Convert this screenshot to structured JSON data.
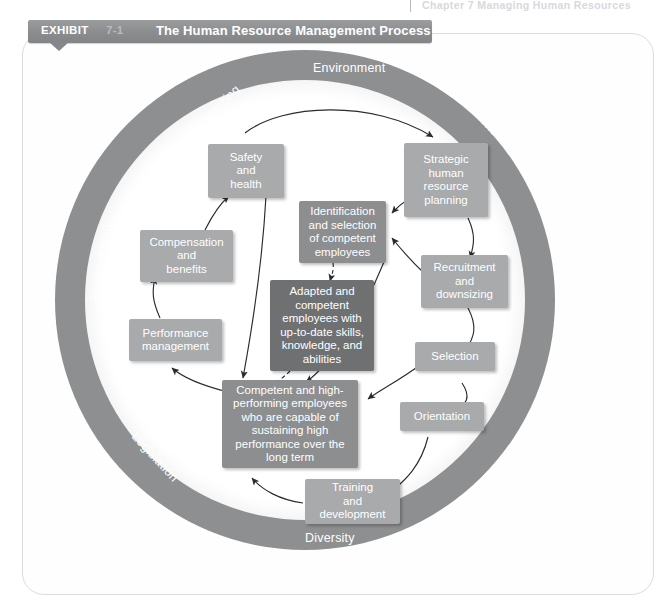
{
  "runhead": {
    "text": "Chapter 7  Managing Human Resources"
  },
  "header": {
    "exhibit_label": "EXHIBIT",
    "exhibit_number": "7-1",
    "title": "The Human Resource Management Process"
  },
  "colors": {
    "ring": "#8d8f91",
    "box_light": "#a8aaac",
    "box_mid": "#8c8e90",
    "box_dark": "#6e7072",
    "header_bar": "#8b8d8f",
    "text": "#ffffff"
  },
  "environment_factors": [
    {
      "name": "environment",
      "label": "Environment"
    },
    {
      "name": "downsizing",
      "label": "Downsizing"
    },
    {
      "name": "unions",
      "label": "Unions"
    },
    {
      "name": "restructuring",
      "label": "Restructuring"
    },
    {
      "name": "work-process",
      "label": "Work Process"
    },
    {
      "name": "legislation",
      "label": "Legislation"
    },
    {
      "name": "diversity",
      "label": "Diversity"
    }
  ],
  "process_steps": [
    {
      "name": "strategic-human-resource-planning",
      "label": "Strategic\nhuman\nresource\nplanning"
    },
    {
      "name": "recruitment-and-downsizing",
      "label": "Recruitment\nand\ndownsizing"
    },
    {
      "name": "selection",
      "label": "Selection"
    },
    {
      "name": "orientation",
      "label": "Orientation"
    },
    {
      "name": "training-and-development",
      "label": "Training\nand\ndevelopment"
    },
    {
      "name": "performance-management",
      "label": "Performance\nmanagement"
    },
    {
      "name": "compensation-and-benefits",
      "label": "Compensation\nand\nbenefits"
    },
    {
      "name": "safety-and-health",
      "label": "Safety\nand\nhealth"
    }
  ],
  "outcome_boxes": [
    {
      "name": "identification-and-selection",
      "label": "Identification\nand selection\nof competent\nemployees"
    },
    {
      "name": "adapted-and-competent-employees",
      "label": "Adapted and\ncompetent\nemployees with\nup-to-date skills,\nknowledge, and\nabilities"
    },
    {
      "name": "competent-high-performing-employees",
      "label": "Competent and high-\nperforming employees\nwho are capable of\nsustaining high\nperformance over the\nlong term"
    }
  ]
}
